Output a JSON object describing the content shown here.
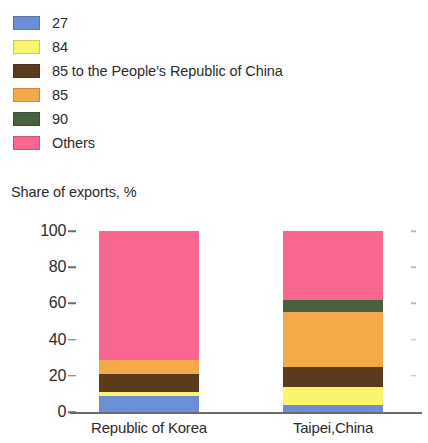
{
  "legend": {
    "items": [
      {
        "label": "27",
        "color": "#6b8ed6"
      },
      {
        "label": "84",
        "color": "#faf46e"
      },
      {
        "label": "85 to the People’s Republic of China",
        "color": "#5c3a1e"
      },
      {
        "label": "85",
        "color": "#f4a94b"
      },
      {
        "label": "90",
        "color": "#46613c"
      },
      {
        "label": "Others",
        "color": "#f9668f"
      }
    ]
  },
  "chart_data": {
    "type": "bar",
    "stacked": true,
    "title": "",
    "subtitle": "",
    "ylabel": "Share of exports, %",
    "xlabel": "",
    "ylim": [
      0,
      100
    ],
    "yticks": [
      0,
      20,
      40,
      60,
      80,
      100
    ],
    "ytick_labels": [
      "0",
      "20",
      "40",
      "60",
      "80",
      "100"
    ],
    "grid": false,
    "legend_position": "top-left",
    "categories": [
      "Republic of Korea",
      "Taipei,China"
    ],
    "series": [
      {
        "name": "27",
        "color": "#6b8ed6",
        "values": [
          9,
          4
        ]
      },
      {
        "name": "84",
        "color": "#faf46e",
        "values": [
          2,
          10
        ]
      },
      {
        "name": "85 to the People’s Republic of China",
        "color": "#5c3a1e",
        "values": [
          10,
          11
        ]
      },
      {
        "name": "85",
        "color": "#f4a94b",
        "values": [
          8,
          30
        ]
      },
      {
        "name": "90",
        "color": "#46613c",
        "values": [
          0,
          7
        ]
      },
      {
        "name": "Others",
        "color": "#f9668f",
        "values": [
          71,
          38
        ]
      }
    ]
  }
}
